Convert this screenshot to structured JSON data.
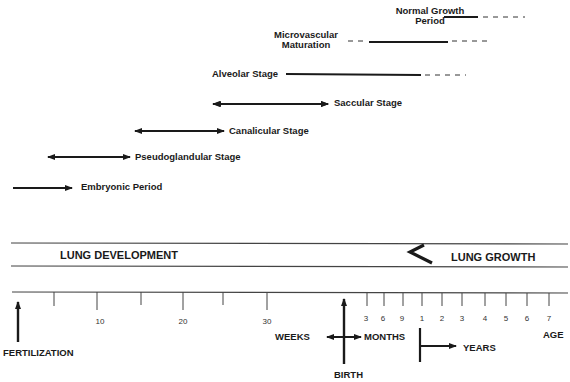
{
  "diagram": {
    "stages": [
      {
        "label": "Normal Growth\nPeriod",
        "line1": "Normal Growth",
        "line2": "Period"
      },
      {
        "label": "Microvascular\nMaturation",
        "line1": "Microvascular",
        "line2": "Maturation"
      },
      {
        "label": "Alveolar Stage"
      },
      {
        "label": "Saccular Stage"
      },
      {
        "label": "Canalicular Stage"
      },
      {
        "label": "Pseudoglandular Stage"
      },
      {
        "label": "Embryonic Period"
      }
    ],
    "bands": {
      "left": "LUNG DEVELOPMENT",
      "right": "LUNG GROWTH"
    },
    "axis": {
      "weeks_ticks": [
        "10",
        "20",
        "30"
      ],
      "months_ticks": [
        "3",
        "6",
        "9"
      ],
      "years_ticks": [
        "1",
        "2",
        "3",
        "4",
        "5",
        "6",
        "7"
      ],
      "weeks_label": "WEEKS",
      "months_label": "MONTHS",
      "years_label": "YEARS",
      "age_label": "AGE"
    },
    "markers": {
      "fertilization": "FERTILIZATION",
      "birth": "BIRTH"
    }
  }
}
